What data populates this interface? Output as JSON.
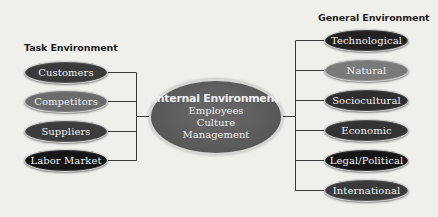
{
  "task_environment": {
    "title": "Task Environment",
    "items": [
      {
        "label": "Customers",
        "color": "#3a3a3a"
      },
      {
        "label": "Competitors",
        "color": "#6b6b6b"
      },
      {
        "label": "Suppliers",
        "color": "#3c3c3c"
      },
      {
        "label": "Labor Market",
        "color": "#151515"
      }
    ]
  },
  "internal_environment": {
    "title": "Internal Environment",
    "items": [
      "Employees",
      "Culture",
      "Management"
    ],
    "color": "#5c5c5c"
  },
  "general_environment": {
    "title": "General Environment",
    "items": [
      {
        "label": "Technological",
        "color": "#222222"
      },
      {
        "label": "Natural",
        "color": "#7a7a7a"
      },
      {
        "label": "Sociocultural",
        "color": "#2e2e2e"
      },
      {
        "label": "Economic",
        "color": "#333333"
      },
      {
        "label": "Legal/Political",
        "color": "#151515"
      },
      {
        "label": "International",
        "color": "#3a3a3a"
      }
    ]
  },
  "colors": {
    "background": "#efefec",
    "connector": "#3a3a3a",
    "node_border": "#d8d8d8"
  }
}
